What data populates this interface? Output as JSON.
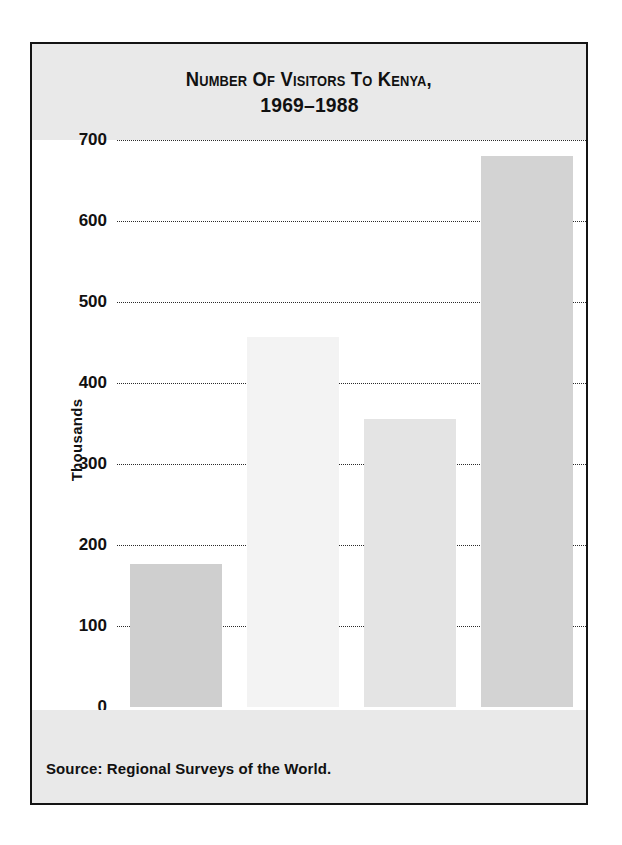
{
  "figure": {
    "title_line_1": "Number of Visitors to Kenya,",
    "title_line_2": "1969–1988",
    "source_note": "Source: Regional Surveys of the World.",
    "colors": {
      "frame_border": "#141414",
      "banner_background": "#e9e9e9",
      "plot_background": "#ffffff",
      "text": "#111111",
      "gridline": "#2b2b2b"
    }
  },
  "chart_data": {
    "type": "bar",
    "title": "Number of Visitors to Kenya, 1969–1988",
    "categories": [
      "1969",
      "1976",
      "1982",
      "1988"
    ],
    "values": [
      177,
      457,
      355,
      680
    ],
    "bar_colors": [
      "#cfcfcf",
      "#f3f3f3",
      "#e4e4e4",
      "#d3d3d3"
    ],
    "xlabel": "Year",
    "ylabel": "Thousands",
    "ylim": [
      0,
      700
    ],
    "ytick_values": [
      0,
      100,
      200,
      300,
      400,
      500,
      600,
      700
    ],
    "ytick_labels": [
      "0",
      "100",
      "200",
      "300",
      "400",
      "500",
      "600",
      "700"
    ],
    "grid": "horizontal-dotted",
    "legend": "none",
    "source": "Regional Surveys of the World."
  }
}
